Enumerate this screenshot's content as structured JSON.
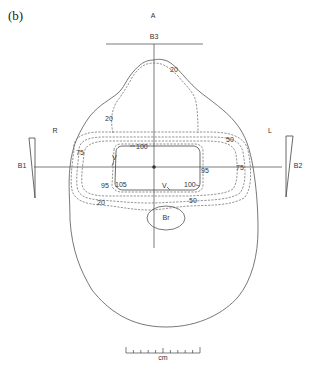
{
  "figure": {
    "panel_label": "(b)",
    "orientation": {
      "anterior": "A",
      "right": "R",
      "left": "L"
    },
    "beams": [
      {
        "id": "B1",
        "side": "right",
        "wedged": true
      },
      {
        "id": "B2",
        "side": "left",
        "wedged": true
      },
      {
        "id": "B3",
        "side": "anterior",
        "wedged": false
      }
    ],
    "structures": [
      {
        "id": "Br",
        "name": "Br"
      },
      {
        "id": "V",
        "name": "V"
      }
    ],
    "isodose_labels": {
      "anterior_20": "20",
      "right_20": "20",
      "inferior_20": "20",
      "right_75": "75",
      "left_75": "75",
      "left_50": "50",
      "inferior_50": "50",
      "top_100": "100",
      "right_100": "100",
      "right_95": "95",
      "left_95": "95",
      "hot_105": "105",
      "v_upper": "V",
      "v_lower": "V"
    },
    "isodose_levels_percent": [
      20,
      50,
      75,
      95,
      100,
      105
    ],
    "scale_bar": {
      "unit": "cm",
      "ticks": 10
    }
  }
}
